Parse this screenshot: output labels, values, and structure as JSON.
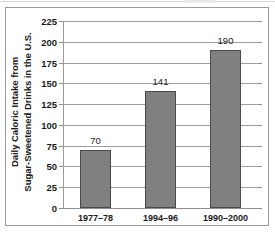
{
  "chart_data": {
    "type": "bar",
    "title": "",
    "subtitle": "",
    "xlabel": "",
    "ylabel": "Daily Caloric Intake from Sugar-Sweetened Drinks in the U.S.",
    "ylabel_line1": "Daily Caloric Intake from",
    "ylabel_line2": "Sugar-Sweetened Drinks in the U.S.",
    "categories": [
      "1977–78",
      "1994–96",
      "1990–2000"
    ],
    "values": [
      70,
      141,
      190
    ],
    "value_labels": [
      "70",
      "141",
      "190"
    ],
    "ylim": [
      0,
      225
    ],
    "ytick_interval": 25,
    "ytick_labels": [
      "225",
      "200",
      "175",
      "150",
      "125",
      "100",
      "75",
      "50",
      "25",
      "0"
    ],
    "ytick_values": [
      225,
      200,
      175,
      150,
      125,
      100,
      75,
      50,
      25,
      0
    ],
    "grid": true,
    "grid_axis": "y",
    "legend": false,
    "legend_position": "none",
    "bar_color": "#808080",
    "bar_border_color": "#4a4a4a",
    "grid_color": "#9e9e9e",
    "axis_color": "#8f8f8f",
    "frame_color": "#9a9a9a",
    "text_color": "#1a1a1a",
    "background": "#ffffff"
  }
}
